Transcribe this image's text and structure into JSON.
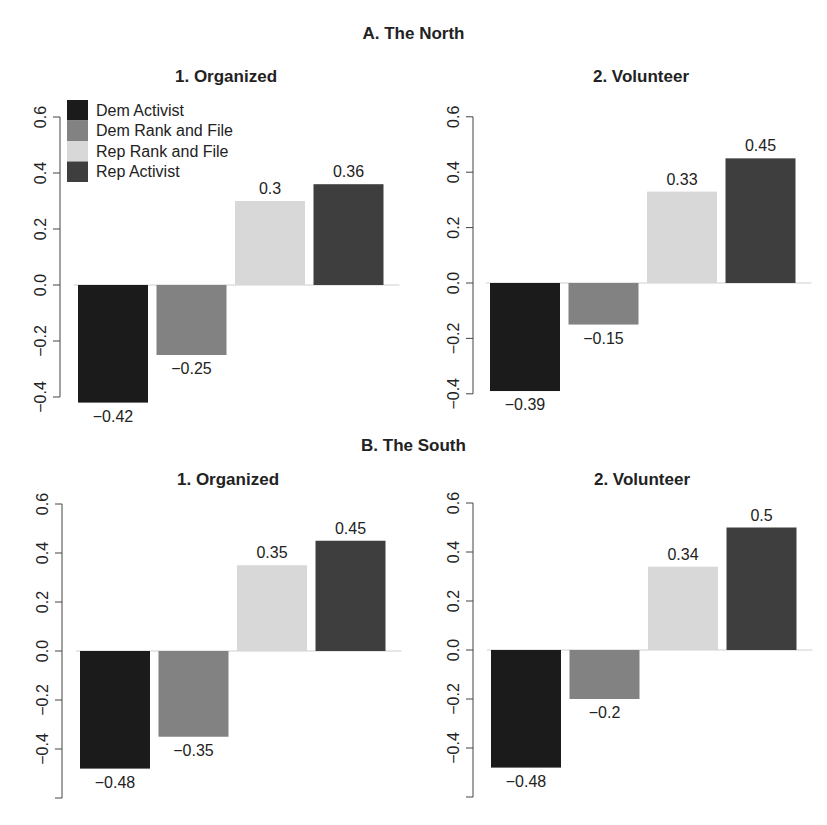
{
  "sections": [
    {
      "title": "A. The North"
    },
    {
      "title": "B. The South"
    }
  ],
  "legend": [
    {
      "label": "Dem Activist",
      "color": "#1b1b1b"
    },
    {
      "label": "Dem Rank and File",
      "color": "#828282"
    },
    {
      "label": "Rep Rank and File",
      "color": "#d8d8d8"
    },
    {
      "label": "Rep Activist",
      "color": "#3e3e3e"
    }
  ],
  "chart_data": [
    {
      "type": "bar",
      "section": "A. The North",
      "title": "1. Organized",
      "categories": [
        "Dem Activist",
        "Dem Rank and File",
        "Rep Rank and File",
        "Rep Activist"
      ],
      "values": [
        -0.42,
        -0.25,
        0.3,
        0.36
      ],
      "value_labels": [
        "−0.42",
        "−0.25",
        "0.3",
        "0.36"
      ],
      "yticks": [
        "0.6",
        "0.4",
        "0.2",
        "0.0",
        "−0.2",
        "−0.4"
      ],
      "ylim": [
        -0.4,
        0.6
      ],
      "xlabel": "",
      "ylabel": "",
      "legend_position": "top-left",
      "grid": false
    },
    {
      "type": "bar",
      "section": "A. The North",
      "title": "2. Volunteer",
      "categories": [
        "Dem Activist",
        "Dem Rank and File",
        "Rep Rank and File",
        "Rep Activist"
      ],
      "values": [
        -0.39,
        -0.15,
        0.33,
        0.45
      ],
      "value_labels": [
        "−0.39",
        "−0.15",
        "0.33",
        "0.45"
      ],
      "yticks": [
        "0.6",
        "0.4",
        "0.2",
        "0.0",
        "−0.2",
        "−0.4"
      ],
      "ylim": [
        -0.4,
        0.6
      ],
      "xlabel": "",
      "ylabel": "",
      "grid": false
    },
    {
      "type": "bar",
      "section": "B. The South",
      "title": "1. Organized",
      "categories": [
        "Dem Activist",
        "Dem Rank and File",
        "Rep Rank and File",
        "Rep Activist"
      ],
      "values": [
        -0.48,
        -0.35,
        0.35,
        0.45
      ],
      "value_labels": [
        "−0.48",
        "−0.35",
        "0.35",
        "0.45"
      ],
      "yticks": [
        "0.6",
        "0.4",
        "0.2",
        "0.0",
        "−0.2",
        "−0.4",
        ""
      ],
      "ylim": [
        -0.6,
        0.6
      ],
      "xlabel": "",
      "ylabel": "",
      "grid": false
    },
    {
      "type": "bar",
      "section": "B. The South",
      "title": "2. Volunteer",
      "categories": [
        "Dem Activist",
        "Dem Rank and File",
        "Rep Rank and File",
        "Rep Activist"
      ],
      "values": [
        -0.48,
        -0.2,
        0.34,
        0.5
      ],
      "value_labels": [
        "−0.48",
        "−0.2",
        "0.34",
        "0.5"
      ],
      "yticks": [
        "0.6",
        "0.4",
        "0.2",
        "0.0",
        "−0.2",
        "−0.4",
        ""
      ],
      "ylim": [
        -0.6,
        0.6
      ],
      "xlabel": "",
      "ylabel": "",
      "grid": false
    }
  ]
}
